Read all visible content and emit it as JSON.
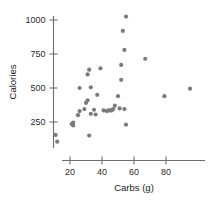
{
  "chart_data": {
    "type": "scatter",
    "title": "",
    "xlabel": "Carbs (g)",
    "ylabel": "Calories",
    "xlim": [
      5,
      97
    ],
    "ylim": [
      60,
      1060
    ],
    "xticks": [
      20,
      40,
      60,
      80
    ],
    "yticks": [
      250,
      500,
      750,
      1000
    ],
    "xtick_labels": [
      "20",
      "40",
      "60",
      "80"
    ],
    "ytick_labels": [
      "250",
      "500",
      "750",
      "1000"
    ],
    "grid": false,
    "legend": "none",
    "marker_color": "#7b7b7b",
    "axis_color": "#6e6e6e",
    "points": [
      {
        "x": 11,
        "y": 155
      },
      {
        "x": 12,
        "y": 105
      },
      {
        "x": 21,
        "y": 235
      },
      {
        "x": 22,
        "y": 245
      },
      {
        "x": 22,
        "y": 225
      },
      {
        "x": 25,
        "y": 300
      },
      {
        "x": 26,
        "y": 330
      },
      {
        "x": 26,
        "y": 500
      },
      {
        "x": 29,
        "y": 345
      },
      {
        "x": 30,
        "y": 390
      },
      {
        "x": 31,
        "y": 410
      },
      {
        "x": 31,
        "y": 600
      },
      {
        "x": 32,
        "y": 150
      },
      {
        "x": 32,
        "y": 635
      },
      {
        "x": 33,
        "y": 310
      },
      {
        "x": 33,
        "y": 505
      },
      {
        "x": 35,
        "y": 340
      },
      {
        "x": 36,
        "y": 305
      },
      {
        "x": 37,
        "y": 450
      },
      {
        "x": 39,
        "y": 645
      },
      {
        "x": 41,
        "y": 335
      },
      {
        "x": 43,
        "y": 330
      },
      {
        "x": 44,
        "y": 335
      },
      {
        "x": 45,
        "y": 335
      },
      {
        "x": 46,
        "y": 335
      },
      {
        "x": 47,
        "y": 345
      },
      {
        "x": 48,
        "y": 370
      },
      {
        "x": 50,
        "y": 440
      },
      {
        "x": 51,
        "y": 350
      },
      {
        "x": 52,
        "y": 560
      },
      {
        "x": 52,
        "y": 670
      },
      {
        "x": 53,
        "y": 920
      },
      {
        "x": 54,
        "y": 345
      },
      {
        "x": 54,
        "y": 780
      },
      {
        "x": 55,
        "y": 1025
      },
      {
        "x": 55,
        "y": 230
      },
      {
        "x": 67,
        "y": 715
      },
      {
        "x": 79,
        "y": 440
      },
      {
        "x": 95,
        "y": 495
      }
    ]
  }
}
